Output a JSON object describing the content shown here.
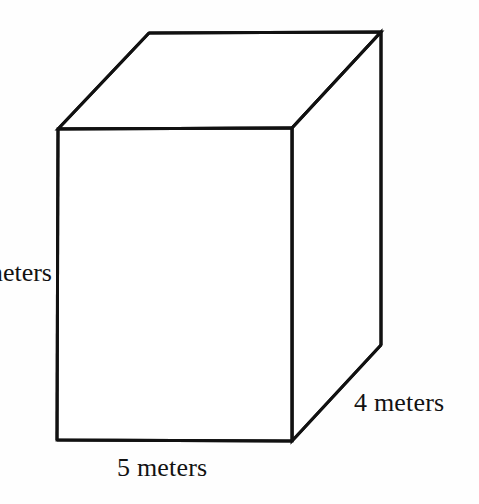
{
  "figure": {
    "type": "rectangular-prism-diagram",
    "background_color": "#fefefe",
    "stroke_color": "#111111",
    "stroke_width": 3,
    "fill_color": "#ffffff"
  },
  "labels": {
    "width": "5 meters",
    "depth": "4 meters",
    "height_visible_text": "eters",
    "height_full_text": "meters"
  },
  "dimensions": {
    "width_value": 5,
    "depth_value": 4,
    "unit": "meters"
  },
  "geometry": {
    "front_top_left": [
      58,
      129
    ],
    "front_top_right": [
      292,
      128
    ],
    "front_bottom_right": [
      292,
      441
    ],
    "front_bottom_left": [
      57,
      440
    ],
    "back_top_left": [
      149,
      33
    ],
    "back_top_right": [
      381,
      32
    ],
    "back_bottom_right": [
      381,
      345
    ]
  }
}
